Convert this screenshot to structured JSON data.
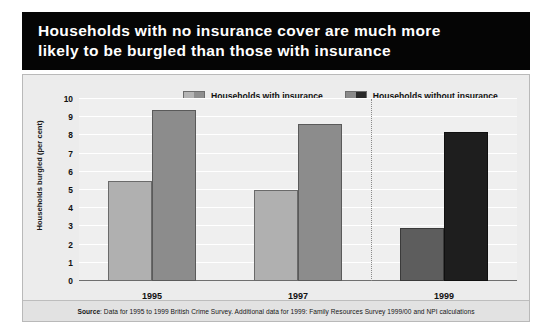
{
  "title": {
    "line1": "Households with no insurance cover are much more",
    "line2": "likely to be burgled than those with insurance"
  },
  "legend": {
    "items": [
      {
        "label": "Households with insurance",
        "color": "#b0b0b0"
      },
      {
        "label": "Households without insurance",
        "color": "#8c8c8c"
      }
    ]
  },
  "source": {
    "label": "Source",
    "text": ": Data for 1995 to 1999 British Crime Survey. Additional data for 1999: Family Resources Survey 1999/00 and NPI calculations"
  },
  "chart_data": {
    "type": "bar",
    "title": "Households with no insurance cover are much more likely to be burgled than those with insurance",
    "xlabel": "",
    "ylabel": "Households burgled (per cent)",
    "categories": [
      "1995",
      "1997",
      "1999"
    ],
    "ylim": [
      0,
      10
    ],
    "yticks": [
      "0",
      "1",
      "2",
      "3",
      "4",
      "5",
      "6",
      "7",
      "8",
      "9",
      "10"
    ],
    "grid": true,
    "legend_position": "top",
    "series": [
      {
        "name": "Households with insurance",
        "values": [
          5.5,
          5.0,
          2.9
        ]
      },
      {
        "name": "Households without insurance",
        "values": [
          9.4,
          8.6,
          8.2
        ]
      }
    ],
    "annotations": [
      {
        "type": "vertical-dotted-divider",
        "between": [
          "1997",
          "1999"
        ]
      }
    ]
  }
}
